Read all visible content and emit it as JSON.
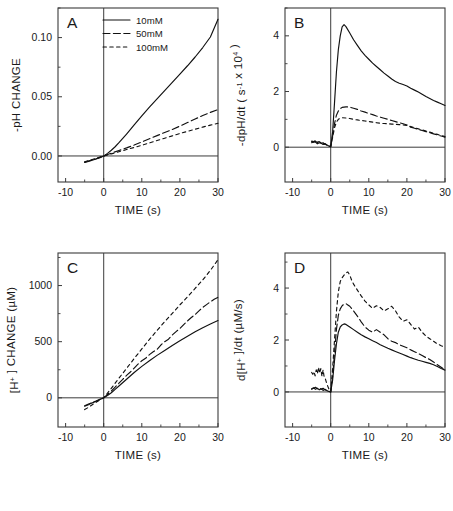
{
  "figure": {
    "panels_order": [
      "A",
      "B",
      "C",
      "D"
    ],
    "caption_fragment": "Fig. 1. (A) Initial pH change, (B) rate of pH change, (C) [H+] change and (D) rate of [H+] change."
  },
  "legend": {
    "items": [
      {
        "label": "10mM",
        "style": "solid"
      },
      {
        "label": "50mM",
        "style": "dash-long"
      },
      {
        "label": "100mM",
        "style": "dash-short"
      }
    ]
  },
  "axes": {
    "x_label": "TIME (s)",
    "x_ticks": [
      "-10",
      "0",
      "10",
      "20",
      "30"
    ],
    "x_tick_values": [
      -10,
      0,
      10,
      20,
      30
    ],
    "x_minor_values": [
      -5,
      5,
      15,
      25
    ]
  },
  "chart_data": [
    {
      "id": "A",
      "type": "line",
      "panel_letter": "A",
      "title": "",
      "xlabel": "TIME (s)",
      "ylabel": "-pH CHANGE",
      "ylabel_parts": [
        {
          "text": "-pH CHANGE",
          "sup": ""
        }
      ],
      "xlim": [
        -12,
        30
      ],
      "ylim": [
        -0.022,
        0.125
      ],
      "y_ticks": [
        "0.00",
        "0.05",
        "0.10"
      ],
      "y_tick_values": [
        0.0,
        0.05,
        0.1
      ],
      "y_minor_values": [
        0.025,
        0.075,
        0.125
      ],
      "grid": false,
      "legend_position": "top-center",
      "series": [
        {
          "name": "10mM",
          "style": "solid",
          "x": [
            -5,
            -4,
            -3,
            -2,
            -1,
            0,
            1,
            2,
            3,
            4,
            5,
            6,
            8,
            10,
            12,
            14,
            16,
            18,
            20,
            22,
            24,
            26,
            28,
            30
          ],
          "y": [
            -0.0055,
            -0.0046,
            -0.0036,
            -0.0026,
            -0.0014,
            0.0,
            0.0022,
            0.0048,
            0.0078,
            0.0112,
            0.0148,
            0.0185,
            0.0262,
            0.0338,
            0.0412,
            0.0482,
            0.0552,
            0.0622,
            0.0692,
            0.0762,
            0.0836,
            0.0916,
            0.1005,
            0.1155
          ]
        },
        {
          "name": "50mM",
          "style": "dash-long",
          "x": [
            -5,
            -4,
            -3,
            -2,
            -1,
            0,
            2,
            4,
            6,
            8,
            10,
            12,
            14,
            16,
            18,
            20,
            22,
            24,
            26,
            28,
            30
          ],
          "y": [
            -0.0052,
            -0.0042,
            -0.0033,
            -0.0023,
            -0.0012,
            0.0,
            0.0024,
            0.0046,
            0.0068,
            0.0092,
            0.0118,
            0.0145,
            0.0172,
            0.0198,
            0.0224,
            0.0252,
            0.0282,
            0.0312,
            0.0342,
            0.0368,
            0.0392
          ]
        },
        {
          "name": "100mM",
          "style": "dash-short",
          "x": [
            -5,
            -4,
            -3,
            -2,
            -1,
            0,
            2,
            4,
            6,
            8,
            10,
            12,
            14,
            16,
            18,
            20,
            22,
            24,
            26,
            28,
            30
          ],
          "y": [
            -0.005,
            -0.004,
            -0.003,
            -0.002,
            -0.001,
            0.0,
            0.0018,
            0.0036,
            0.0054,
            0.0072,
            0.009,
            0.011,
            0.013,
            0.015,
            0.017,
            0.019,
            0.0208,
            0.0226,
            0.0244,
            0.026,
            0.0276
          ]
        }
      ]
    },
    {
      "id": "B",
      "type": "line",
      "panel_letter": "B",
      "title": "",
      "xlabel": "TIME (s)",
      "ylabel": "-dpH/dt ( s-1 x 104 )",
      "ylabel_parts": [
        {
          "text": "-dpH/dt ( s",
          "sup": ""
        },
        {
          "text": "-1",
          "sup": "true"
        },
        {
          "text": " x 10",
          "sup": ""
        },
        {
          "text": "4",
          "sup": "true"
        },
        {
          "text": " )",
          "sup": ""
        }
      ],
      "xlim": [
        -12,
        30
      ],
      "ylim": [
        -1.25,
        5.0
      ],
      "y_ticks": [
        "0",
        "2",
        "4"
      ],
      "y_tick_values": [
        0,
        2,
        4
      ],
      "y_minor_values": [
        1,
        3,
        5
      ],
      "grid": false,
      "legend_position": "none",
      "series": [
        {
          "name": "10mM",
          "style": "solid",
          "x": [
            -5,
            -4.5,
            -4,
            -3.5,
            -3,
            -2.5,
            -2,
            -1.5,
            -1,
            -0.5,
            0,
            0.5,
            1,
            1.5,
            2,
            2.5,
            3,
            3.5,
            4,
            5,
            6,
            7,
            8,
            9,
            10,
            11,
            12,
            13,
            14,
            15,
            16,
            17,
            18,
            19,
            20,
            21,
            22,
            23,
            24,
            25,
            26,
            27,
            28,
            29,
            30
          ],
          "y": [
            0.16,
            0.2,
            0.18,
            0.12,
            0.16,
            0.14,
            0.1,
            0.12,
            0.08,
            0.04,
            0.02,
            0.55,
            1.6,
            2.7,
            3.5,
            4.0,
            4.32,
            4.4,
            4.33,
            4.1,
            3.86,
            3.66,
            3.46,
            3.3,
            3.16,
            3.02,
            2.9,
            2.78,
            2.66,
            2.56,
            2.45,
            2.36,
            2.3,
            2.25,
            2.2,
            2.12,
            2.05,
            1.98,
            1.9,
            1.82,
            1.75,
            1.68,
            1.62,
            1.56,
            1.5
          ]
        },
        {
          "name": "50mM",
          "style": "dash-long",
          "x": [
            -5,
            -4.5,
            -4,
            -3.5,
            -3,
            -2.5,
            -2,
            -1.5,
            -1,
            -0.5,
            0,
            0.5,
            1,
            1.5,
            2,
            2.5,
            3,
            4,
            5,
            6,
            7,
            8,
            9,
            10,
            11,
            12,
            13,
            14,
            15,
            16,
            17,
            18,
            19,
            20,
            21,
            22,
            23,
            24,
            25,
            26,
            27,
            28,
            29,
            30
          ],
          "y": [
            0.2,
            0.18,
            0.22,
            0.16,
            0.2,
            0.14,
            0.16,
            0.1,
            0.08,
            0.05,
            0.02,
            0.4,
            0.85,
            1.15,
            1.3,
            1.38,
            1.43,
            1.45,
            1.44,
            1.4,
            1.36,
            1.3,
            1.26,
            1.21,
            1.17,
            1.12,
            1.08,
            1.04,
            1.0,
            0.96,
            0.92,
            0.88,
            0.84,
            0.8,
            0.72,
            0.68,
            0.64,
            0.6,
            0.56,
            0.52,
            0.48,
            0.44,
            0.4,
            0.36
          ]
        },
        {
          "name": "100mM",
          "style": "dash-short",
          "x": [
            -5,
            -4.5,
            -4,
            -3.5,
            -3,
            -2.5,
            -2,
            -1.5,
            -1,
            -0.5,
            0,
            0.5,
            1,
            1.5,
            2,
            2.5,
            3,
            4,
            5,
            6,
            7,
            8,
            9,
            10,
            11,
            12,
            13,
            14,
            15,
            16,
            17,
            18,
            19,
            20,
            21,
            22,
            23,
            24,
            25,
            26,
            27,
            28,
            29,
            30
          ],
          "y": [
            0.22,
            0.2,
            0.24,
            0.18,
            0.2,
            0.16,
            0.14,
            0.12,
            0.08,
            0.04,
            0.02,
            0.35,
            0.7,
            0.9,
            1.0,
            1.04,
            1.06,
            1.05,
            1.03,
            1.0,
            0.98,
            0.96,
            0.94,
            0.92,
            0.9,
            0.88,
            0.86,
            0.85,
            0.84,
            0.83,
            0.82,
            0.81,
            0.8,
            0.78,
            0.74,
            0.7,
            0.66,
            0.62,
            0.58,
            0.54,
            0.5,
            0.46,
            0.42,
            0.38
          ]
        }
      ]
    },
    {
      "id": "C",
      "type": "line",
      "panel_letter": "C",
      "title": "",
      "xlabel": "TIME (s)",
      "ylabel": "[H+] CHANGE (uM)",
      "ylabel_parts": [
        {
          "text": "[H",
          "sup": ""
        },
        {
          "text": "+",
          "sup": "true"
        },
        {
          "text": " ] CHANGE (µM)",
          "sup": ""
        }
      ],
      "xlim": [
        -12,
        30
      ],
      "ylim": [
        -260,
        1290
      ],
      "y_ticks": [
        "0",
        "500",
        "1000"
      ],
      "y_tick_values": [
        0,
        500,
        1000
      ],
      "y_minor_values": [
        250,
        750,
        1250
      ],
      "grid": false,
      "legend_position": "none",
      "series": [
        {
          "name": "10mM",
          "style": "solid",
          "x": [
            -5,
            -4,
            -3,
            -2,
            -1,
            0,
            1,
            2,
            3,
            4,
            6,
            8,
            10,
            12,
            14,
            16,
            18,
            20,
            22,
            24,
            26,
            28,
            30
          ],
          "y": [
            -70,
            -55,
            -45,
            -30,
            -15,
            0,
            20,
            45,
            75,
            105,
            165,
            225,
            280,
            330,
            378,
            422,
            466,
            508,
            548,
            588,
            625,
            658,
            688
          ]
        },
        {
          "name": "50mM",
          "style": "dash-long",
          "x": [
            -5,
            -4,
            -3,
            -2,
            -1,
            0,
            1,
            2,
            3,
            4,
            5,
            6,
            7,
            8,
            9,
            10,
            11,
            12,
            13,
            14,
            15,
            16,
            17,
            18,
            19,
            20,
            21,
            22,
            23,
            24,
            25,
            26,
            27,
            28,
            29,
            30
          ],
          "y": [
            -75,
            -62,
            -40,
            -28,
            -12,
            0,
            30,
            60,
            95,
            130,
            165,
            200,
            230,
            265,
            300,
            330,
            352,
            385,
            410,
            432,
            470,
            500,
            522,
            560,
            590,
            618,
            652,
            685,
            715,
            742,
            775,
            805,
            830,
            855,
            878,
            895
          ]
        },
        {
          "name": "100mM",
          "style": "dash-short",
          "x": [
            -5,
            -4,
            -3,
            -2,
            -1,
            0,
            1,
            2,
            3,
            4,
            6,
            8,
            10,
            12,
            14,
            16,
            18,
            20,
            22,
            24,
            26,
            28,
            30
          ],
          "y": [
            -105,
            -85,
            -62,
            -40,
            -18,
            0,
            42,
            85,
            130,
            175,
            262,
            350,
            435,
            520,
            600,
            678,
            752,
            828,
            900,
            975,
            1050,
            1135,
            1230
          ]
        }
      ]
    },
    {
      "id": "D",
      "type": "line",
      "panel_letter": "D",
      "title": "",
      "xlabel": "TIME (s)",
      "ylabel": "d[H+]/dt (uM/s)",
      "ylabel_parts": [
        {
          "text": "d[H",
          "sup": ""
        },
        {
          "text": "+",
          "sup": "true"
        },
        {
          "text": " ]/dt (µM/s)",
          "sup": ""
        }
      ],
      "xlim": [
        -12,
        30
      ],
      "ylim": [
        -1.35,
        5.35
      ],
      "y_ticks": [
        "0",
        "2",
        "4"
      ],
      "y_tick_values": [
        0,
        2,
        4
      ],
      "y_minor_values": [
        1,
        3,
        5
      ],
      "grid": false,
      "legend_position": "none",
      "series": [
        {
          "name": "10mM",
          "style": "solid",
          "x": [
            -5,
            -4.5,
            -4,
            -3.5,
            -3,
            -2.5,
            -2,
            -1.5,
            -1,
            -0.5,
            0,
            0.5,
            1,
            1.5,
            2,
            2.5,
            3,
            3.5,
            4,
            5,
            6,
            7,
            8,
            9,
            10,
            11,
            12,
            13,
            14,
            15,
            16,
            17,
            18,
            19,
            20,
            21,
            22,
            23,
            24,
            25,
            26,
            27,
            28,
            29,
            30
          ],
          "y": [
            0.12,
            0.16,
            0.1,
            0.14,
            0.08,
            0.12,
            0.06,
            0.1,
            0.05,
            0.02,
            0.0,
            0.45,
            1.2,
            1.85,
            2.3,
            2.5,
            2.58,
            2.62,
            2.6,
            2.5,
            2.4,
            2.3,
            2.2,
            2.12,
            2.05,
            1.97,
            1.9,
            1.82,
            1.75,
            1.68,
            1.62,
            1.56,
            1.5,
            1.44,
            1.38,
            1.32,
            1.27,
            1.22,
            1.18,
            1.14,
            1.1,
            1.05,
            0.98,
            0.9,
            0.84
          ]
        },
        {
          "name": "50mM",
          "style": "dash-long",
          "x": [
            -5,
            -4.5,
            -4,
            -3.5,
            -3,
            -2.5,
            -2,
            -1.5,
            -1,
            -0.5,
            0,
            0.5,
            1,
            1.5,
            2,
            2.5,
            3,
            3.5,
            4,
            4.5,
            5,
            6,
            7,
            8,
            9,
            10,
            11,
            12,
            13,
            14,
            15,
            16,
            17,
            18,
            19,
            20,
            21,
            22,
            23,
            24,
            25,
            26,
            27,
            28,
            29,
            30
          ],
          "y": [
            0.1,
            0.14,
            0.18,
            0.12,
            0.16,
            0.1,
            0.14,
            0.08,
            0.06,
            0.03,
            0.0,
            0.6,
            1.5,
            2.4,
            2.95,
            3.2,
            3.32,
            3.38,
            3.4,
            3.35,
            3.3,
            3.12,
            2.92,
            2.7,
            2.5,
            2.38,
            2.3,
            2.4,
            2.3,
            2.2,
            2.05,
            1.95,
            1.9,
            1.82,
            1.76,
            1.7,
            1.62,
            1.55,
            1.48,
            1.4,
            1.32,
            1.25,
            1.15,
            1.05,
            0.95,
            0.85
          ]
        },
        {
          "name": "100mM",
          "style": "dash-short",
          "x": [
            -5,
            -4.7,
            -4.4,
            -4.1,
            -3.8,
            -3.5,
            -3.2,
            -2.9,
            -2.6,
            -2.3,
            -2,
            -1.7,
            -1.4,
            -1,
            -0.5,
            0,
            0.5,
            1,
            1.5,
            2,
            2.5,
            3,
            3.5,
            4,
            4.5,
            5,
            5.5,
            6,
            7,
            8,
            9,
            10,
            11,
            12,
            13,
            14,
            15,
            16,
            17,
            18,
            19,
            20,
            21,
            22,
            23,
            24,
            25,
            26,
            27,
            28,
            29,
            30
          ],
          "y": [
            0.75,
            0.68,
            0.78,
            0.62,
            0.85,
            0.7,
            0.95,
            0.72,
            0.9,
            0.6,
            0.85,
            0.55,
            0.5,
            0.3,
            0.12,
            0.0,
            0.9,
            2.0,
            3.1,
            3.85,
            4.25,
            4.4,
            4.5,
            4.58,
            4.62,
            4.5,
            4.3,
            4.15,
            3.92,
            3.7,
            3.5,
            3.35,
            3.22,
            3.32,
            3.25,
            3.12,
            3.2,
            3.3,
            3.12,
            2.88,
            2.72,
            2.78,
            2.6,
            2.42,
            2.5,
            2.3,
            2.15,
            2.05,
            1.95,
            1.85,
            1.78,
            1.72
          ]
        }
      ]
    }
  ]
}
